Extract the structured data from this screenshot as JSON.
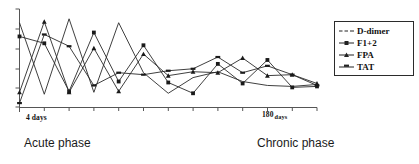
{
  "chart_data": {
    "type": "line",
    "title": "",
    "xlabel": "",
    "ylabel": "",
    "grid": false,
    "legend_position": "right",
    "x_tick_count": 13,
    "x_axis_start_label": "4 days",
    "x_axis_end_value": "180",
    "x_axis_end_unit": "days",
    "x": [
      1,
      2,
      3,
      4,
      5,
      6,
      7,
      8,
      9,
      10,
      11,
      12,
      13
    ],
    "xlim": [
      1,
      13
    ],
    "ylim": [
      0,
      10
    ],
    "y_tick_count": 6,
    "annotations": [
      "Acute phase",
      "Chronic phase"
    ],
    "series": [
      {
        "name": "D-dimer",
        "marker": "none",
        "values": [
          8.6,
          1.3,
          9.0,
          1.5,
          8.6,
          3.5,
          1.4,
          3.0,
          3.6,
          2.6,
          2.2,
          2.1,
          2.3
        ]
      },
      {
        "name": "F1+2",
        "marker": "square",
        "values": [
          7.2,
          6.5,
          1.6,
          7.6,
          2.6,
          6.3,
          2.5,
          1.4,
          4.4,
          2.4,
          4.8,
          2.0,
          2.1
        ]
      },
      {
        "name": "FPA",
        "marker": "triangle",
        "values": [
          1.5,
          8.7,
          1.5,
          6.0,
          1.6,
          5.4,
          3.2,
          3.6,
          3.5,
          5.0,
          3.2,
          3.3,
          2.4
        ]
      },
      {
        "name": "TAT",
        "marker": "bar",
        "values": [
          0.4,
          7.4,
          6.2,
          2.2,
          3.5,
          3.3,
          3.7,
          3.9,
          5.1,
          3.5,
          4.2,
          3.3,
          2.2
        ]
      }
    ]
  },
  "axis": {
    "x_start_label": "4 days",
    "x_end_value": "180",
    "x_end_unit": "days"
  },
  "phases": {
    "acute": "Acute phase",
    "chronic": "Chronic phase"
  },
  "legend": {
    "items": [
      {
        "label": "D-dimer",
        "marker": "dash-line"
      },
      {
        "label": "F1+2",
        "marker": "square-line"
      },
      {
        "label": "FPA",
        "marker": "triangle-line"
      },
      {
        "label": "TAT",
        "marker": "bar-line"
      }
    ]
  }
}
